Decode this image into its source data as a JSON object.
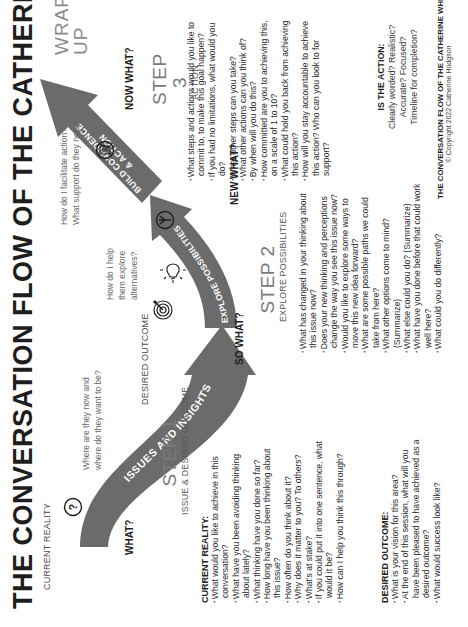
{
  "title": "THE CONVERSATION FLOW OF THE CATHERINE WHEEL",
  "stages": {
    "current_reality_label": "CURRENT REALITY",
    "desired_outcome_label": "DESIRED OUTCOME",
    "wrap_up": [
      "WRAP",
      "UP"
    ]
  },
  "flow_questions": {
    "what": "WHAT?",
    "so_what": "SO WHAT?",
    "new_what": "NEW WHAT?",
    "now_what": "NOW WHAT?"
  },
  "arrows": {
    "arrow1": "ISSUES AND INSIGHTS",
    "arrow2": "EXPLORE POSSIBILITIES",
    "arrow3_line1": "BUILD CONFIDENCE",
    "arrow3_line2": "& ACTION",
    "color": "#6b6b6b",
    "text_color": "#ffffff"
  },
  "coach_prompts": {
    "p1": [
      "Where are they now and",
      "where do they want to be?"
    ],
    "p2": [
      "How do I help",
      "them explore",
      "alternatives?"
    ],
    "p3": [
      "How do I facilitate action?",
      "What support do they need?"
    ]
  },
  "icons": {
    "current_reality": "question-mark-circle-icon",
    "desired_outcome": "target-icon",
    "ideas": "lightbulb-icon",
    "paths": "fork-paths-icon",
    "action": "checklist-icon"
  },
  "step1": {
    "heading": "STEP 1",
    "subheading": "ISSUE & DESIRED OUTCOME",
    "current_reality": {
      "heading": "CURRENT REALITY:",
      "questions": [
        "What would you like to achieve in this conversation?",
        "What have you been avoiding thinking about lately?",
        "What thinking have you done so far?",
        "How long have you been thinking about this issue?",
        "How often do you think about it?",
        "Why does it matter to you? To others?",
        "What's at stake?",
        "If you could put it into one sentence, what would it be?",
        "How can I help you think this through?"
      ]
    },
    "desired_outcome": {
      "heading": "DESIRED OUTCOME:",
      "questions": [
        "What is your vision for this area?",
        "At the end of this session, what will you have been pleased to have achieved as a desired outcome?",
        "What would success look like?"
      ]
    }
  },
  "step2": {
    "heading": "STEP 2",
    "subheading": "EXPLORE POSSIBILITIES",
    "questions": [
      "What has changed in your thinking about this issue now?",
      "Does your new thinking and perceptions change the way you see this issue now?",
      "Would you like to explore some ways to move this new idea forward?",
      "What are some possible paths we could take from here?",
      "What other options come to mind? (Summarize)",
      "What else could you do? (Summarize)",
      "What have you done before that could work well here?",
      "What could you do differently?"
    ]
  },
  "step3": {
    "heading": "STEP 3",
    "subheading": "ACTION",
    "questions": [
      "What steps and actions would you like to commit to, to make this goal happen?",
      "If you had no limitations, what would you do?",
      "What other steps can you take?",
      "What other actions can you think of?",
      "By when will you do this?",
      "How committed are you to achieving this, on a scale of 1 to 10?",
      "What could hold you back from achieving this action?",
      "How will you stay accountable to achieve this action? Who can you look to for support?"
    ]
  },
  "is_the_action": {
    "heading": "IS THE ACTION:",
    "lines": [
      "Clearly worded? Realistic?",
      "Accurate? Focused?",
      "Timeline for completion?"
    ]
  },
  "footer": {
    "title": "THE CONVERSATION FLOW OF THE CATHERINE WHEEL",
    "copyright": "© Copyright 2022 Catherine Hodgson"
  }
}
